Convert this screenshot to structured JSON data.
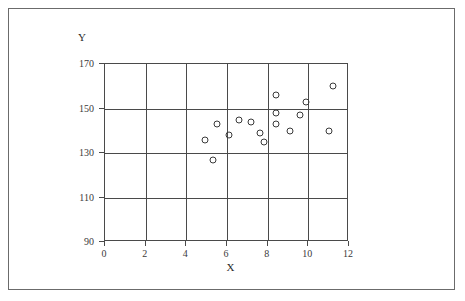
{
  "figure": {
    "border_color": "#6b6b6b",
    "axis_color": "#4a4a4a",
    "marker_color": "#3a3a3a",
    "background": "#ffffff"
  },
  "labels": {
    "x_axis_label": "X",
    "y_axis_label": "Y"
  },
  "chart_data": {
    "type": "scatter",
    "title": "",
    "subtitle": "",
    "xlabel": "X",
    "ylabel": "Y",
    "xlim": [
      0,
      12
    ],
    "ylim": [
      90,
      170
    ],
    "xticks": [
      0,
      2,
      4,
      6,
      8,
      10,
      12
    ],
    "yticks": [
      90,
      110,
      130,
      150,
      170
    ],
    "xticklabels": [
      "0",
      "2",
      "4",
      "6",
      "8",
      "10",
      "12"
    ],
    "yticklabels": [
      "90",
      "110",
      "130",
      "150",
      "170"
    ],
    "grid": true,
    "grid_style": "solid",
    "legend": null,
    "legend_position": "none",
    "marker": "open-circle",
    "marker_size": 7,
    "n_points": 16,
    "series": [
      {
        "name": "observations",
        "points": [
          {
            "x": 4.9,
            "y": 136
          },
          {
            "x": 5.5,
            "y": 143
          },
          {
            "x": 6.1,
            "y": 138
          },
          {
            "x": 5.3,
            "y": 127
          },
          {
            "x": 6.6,
            "y": 145
          },
          {
            "x": 7.2,
            "y": 144
          },
          {
            "x": 7.6,
            "y": 139
          },
          {
            "x": 7.8,
            "y": 135
          },
          {
            "x": 8.4,
            "y": 148
          },
          {
            "x": 8.4,
            "y": 143
          },
          {
            "x": 8.4,
            "y": 156
          },
          {
            "x": 9.1,
            "y": 140
          },
          {
            "x": 9.6,
            "y": 147
          },
          {
            "x": 9.9,
            "y": 153
          },
          {
            "x": 11.0,
            "y": 140
          },
          {
            "x": 11.2,
            "y": 160
          }
        ]
      }
    ]
  }
}
